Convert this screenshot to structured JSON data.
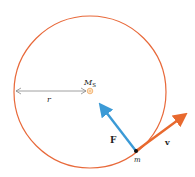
{
  "diagram": {
    "orbit": {
      "cx": 90,
      "cy": 92,
      "r": 76,
      "color": "#e8693a"
    },
    "sun": {
      "label": "M",
      "subscript": "S",
      "color": "#f0a860"
    },
    "radius_label": "r",
    "force_label": "F",
    "velocity_label": "v",
    "mass_label": "m",
    "colors": {
      "force": "#3b9ad6",
      "velocity": "#e8692e",
      "radius_line": "#888888"
    }
  }
}
